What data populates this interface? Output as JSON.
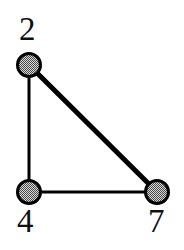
{
  "figure": {
    "background_color": "#ffffff",
    "width": 184,
    "height": 250
  },
  "graph": {
    "type": "undirected-graph",
    "node_style": {
      "shape": "circle",
      "radius": 13,
      "outline_color": "#000000",
      "outline_width": 3,
      "fill_pattern": "halftone-checker",
      "fill_color": "#8c8c8c",
      "fill_background": "#d9d9d9"
    },
    "edge_style": {
      "color": "#000000"
    },
    "nodes": [
      {
        "id": "n2",
        "label": "2",
        "cx": 29,
        "cy": 65,
        "label_x": 19,
        "label_y": 13,
        "label_position": "above-left"
      },
      {
        "id": "n4",
        "label": "4",
        "cx": 29,
        "cy": 192,
        "label_x": 17,
        "label_y": 205,
        "label_position": "below-left"
      },
      {
        "id": "n7",
        "label": "7",
        "cx": 157,
        "cy": 192,
        "label_x": 148,
        "label_y": 205,
        "label_position": "below-right"
      }
    ],
    "edges": [
      {
        "id": "e-2-4",
        "from": "n2",
        "to": "n4",
        "x1": 29,
        "y1": 65,
        "x2": 29,
        "y2": 192,
        "width": 3,
        "orientation": "vertical"
      },
      {
        "id": "e-4-7",
        "from": "n4",
        "to": "n7",
        "x1": 29,
        "y1": 192,
        "x2": 157,
        "y2": 192,
        "width": 3,
        "orientation": "horizontal"
      },
      {
        "id": "e-2-7",
        "from": "n2",
        "to": "n7",
        "x1": 29,
        "y1": 65,
        "x2": 157,
        "y2": 192,
        "width": 5,
        "orientation": "diagonal"
      }
    ]
  }
}
